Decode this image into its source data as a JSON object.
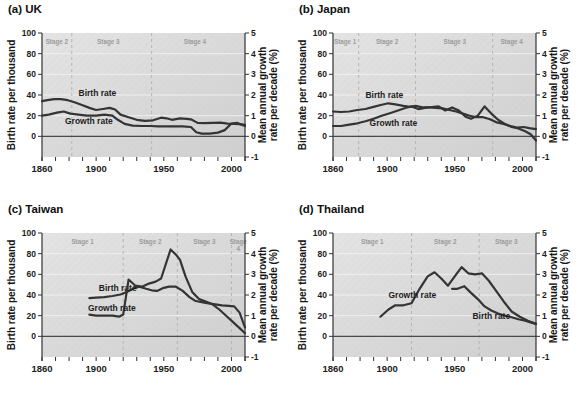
{
  "shared_axes": {
    "left_label": "Birth rate per thousand",
    "right_label_line1": "Mean annual growth",
    "right_label_line2": "rate per decade (%)",
    "left_ticks": [
      0,
      20,
      40,
      60,
      80,
      100
    ],
    "right_ticks": [
      -1,
      0,
      1,
      2,
      3,
      4,
      5
    ],
    "x_ticks_labeled": [
      1860,
      1900,
      1950,
      2000
    ],
    "x_minor_tick_step": 10,
    "x_range": [
      1860,
      2010
    ],
    "left_axis_range": [
      -20,
      100
    ],
    "right_axis_range": [
      -1,
      5
    ]
  },
  "colors": {
    "line": "#343434",
    "plot_bg_light": "#e4e4e4",
    "plot_bg_dark": "#cfcfcf",
    "hatch": "#c6c6c6",
    "gridline": "#efefef",
    "stage_line": "#b5b5b5",
    "stage_label": "#9b9b9b",
    "zero_line": "#4a4a4a",
    "axis_text": "#1c1c1c"
  },
  "chart_data": [
    {
      "type": "line",
      "title": "(a) UK",
      "x_unit": "year",
      "stage_boundaries": [
        1882,
        1941
      ],
      "stage_labels": [
        {
          "text": "Stage 2",
          "year": 1871
        },
        {
          "text": "Stage 3",
          "year": 1909
        },
        {
          "text": "Stage 4",
          "year": 1973
        }
      ],
      "series": [
        {
          "name": "Birth rate",
          "axis": "left",
          "unit": "births per thousand",
          "label": {
            "text": "Birth rate",
            "year": 1887,
            "left_units": 39.5
          },
          "points": [
            [
              1860,
              34
            ],
            [
              1864,
              35
            ],
            [
              1869,
              36
            ],
            [
              1874,
              36
            ],
            [
              1879,
              35
            ],
            [
              1884,
              33
            ],
            [
              1890,
              30
            ],
            [
              1895,
              27.5
            ],
            [
              1900,
              25.5
            ],
            [
              1905,
              26.5
            ],
            [
              1910,
              27.5
            ],
            [
              1914,
              26
            ],
            [
              1918,
              21
            ],
            [
              1924,
              18.5
            ],
            [
              1930,
              16
            ],
            [
              1936,
              15
            ],
            [
              1942,
              15.5
            ],
            [
              1948,
              18
            ],
            [
              1952,
              17.5
            ],
            [
              1956,
              16
            ],
            [
              1962,
              17.5
            ],
            [
              1967,
              17
            ],
            [
              1970,
              16.5
            ],
            [
              1975,
              13
            ],
            [
              1980,
              12.8
            ],
            [
              1986,
              13
            ],
            [
              1992,
              13.2
            ],
            [
              1997,
              12.3
            ],
            [
              2002,
              12
            ],
            [
              2006,
              11.8
            ],
            [
              2010,
              11.2
            ]
          ]
        },
        {
          "name": "Growth rate",
          "axis": "right",
          "unit": "% per year",
          "label": {
            "text": "Growth rate",
            "year": 1877,
            "left_units": 12
          },
          "points": [
            [
              1860,
              1.0
            ],
            [
              1865,
              1.05
            ],
            [
              1871,
              1.15
            ],
            [
              1876,
              1.2
            ],
            [
              1881,
              1.1
            ],
            [
              1887,
              1.05
            ],
            [
              1893,
              1.0
            ],
            [
              1900,
              1.0
            ],
            [
              1906,
              1.05
            ],
            [
              1912,
              1.0
            ],
            [
              1916,
              0.8
            ],
            [
              1921,
              0.6
            ],
            [
              1927,
              0.52
            ],
            [
              1934,
              0.5
            ],
            [
              1940,
              0.5
            ],
            [
              1946,
              0.48
            ],
            [
              1952,
              0.48
            ],
            [
              1958,
              0.48
            ],
            [
              1964,
              0.48
            ],
            [
              1970,
              0.45
            ],
            [
              1974,
              0.2
            ],
            [
              1978,
              0.13
            ],
            [
              1984,
              0.13
            ],
            [
              1990,
              0.18
            ],
            [
              1995,
              0.3
            ],
            [
              2000,
              0.62
            ],
            [
              2004,
              0.65
            ],
            [
              2010,
              0.5
            ]
          ]
        }
      ]
    },
    {
      "type": "line",
      "title": "(b) Japan",
      "x_unit": "year",
      "stage_boundaries": [
        1879,
        1921,
        1978
      ],
      "stage_labels": [
        {
          "text": "Stage 1",
          "year": 1869
        },
        {
          "text": "Stage 2",
          "year": 1900
        },
        {
          "text": "Stage 3",
          "year": 1950
        },
        {
          "text": "Stage 4",
          "year": 1992
        }
      ],
      "series": [
        {
          "name": "Birth rate",
          "axis": "left",
          "unit": "births per thousand",
          "label": {
            "text": "Birth rate",
            "year": 1884,
            "left_units": 37
          },
          "points": [
            [
              1860,
              24
            ],
            [
              1866,
              23.5
            ],
            [
              1872,
              24
            ],
            [
              1878,
              25.5
            ],
            [
              1884,
              26.5
            ],
            [
              1890,
              28.5
            ],
            [
              1896,
              30.5
            ],
            [
              1901,
              32
            ],
            [
              1906,
              31
            ],
            [
              1912,
              29.5
            ],
            [
              1917,
              28.5
            ],
            [
              1921,
              29.5
            ],
            [
              1926,
              28
            ],
            [
              1931,
              28
            ],
            [
              1936,
              27.5
            ],
            [
              1941,
              27
            ],
            [
              1946,
              25.5
            ],
            [
              1951,
              24
            ],
            [
              1956,
              22
            ],
            [
              1961,
              20
            ],
            [
              1966,
              18.5
            ],
            [
              1971,
              18.5
            ],
            [
              1976,
              16.5
            ],
            [
              1981,
              13.5
            ],
            [
              1986,
              12
            ],
            [
              1991,
              10
            ],
            [
              1996,
              8.5
            ],
            [
              2001,
              9
            ],
            [
              2005,
              8
            ],
            [
              2010,
              7
            ]
          ]
        },
        {
          "name": "Growth rate",
          "axis": "right",
          "unit": "% per year",
          "label": {
            "text": "Growth rate",
            "year": 1887,
            "left_units": 10
          },
          "points": [
            [
              1860,
              0.5
            ],
            [
              1866,
              0.5
            ],
            [
              1872,
              0.57
            ],
            [
              1878,
              0.63
            ],
            [
              1884,
              0.73
            ],
            [
              1890,
              0.85
            ],
            [
              1896,
              1.0
            ],
            [
              1902,
              1.12
            ],
            [
              1908,
              1.25
            ],
            [
              1914,
              1.38
            ],
            [
              1918,
              1.45
            ],
            [
              1923,
              1.32
            ],
            [
              1928,
              1.38
            ],
            [
              1933,
              1.42
            ],
            [
              1938,
              1.45
            ],
            [
              1943,
              1.25
            ],
            [
              1948,
              1.4
            ],
            [
              1953,
              1.25
            ],
            [
              1958,
              0.95
            ],
            [
              1962,
              0.85
            ],
            [
              1967,
              1.0
            ],
            [
              1972,
              1.45
            ],
            [
              1977,
              1.1
            ],
            [
              1982,
              0.8
            ],
            [
              1987,
              0.6
            ],
            [
              1992,
              0.45
            ],
            [
              1997,
              0.38
            ],
            [
              2002,
              0.25
            ],
            [
              2006,
              0.1
            ],
            [
              2010,
              -0.2
            ]
          ]
        }
      ]
    },
    {
      "type": "line",
      "title": "(c) Taiwan",
      "x_unit": "year",
      "stage_boundaries": [
        1920,
        1960,
        2000
      ],
      "stage_labels": [
        {
          "text": "Stage 1",
          "year": 1890
        },
        {
          "text": "Stage 2",
          "year": 1940
        },
        {
          "text": "Stage 3",
          "year": 1980
        },
        {
          "text": "Stage",
          "text2": "4",
          "year": 2005
        }
      ],
      "series": [
        {
          "name": "Birth rate",
          "axis": "left",
          "unit": "births per thousand",
          "label": {
            "text": "Birth rate",
            "year": 1902,
            "left_units": 43.5
          },
          "points": [
            [
              1895,
              37
            ],
            [
              1900,
              37.5
            ],
            [
              1906,
              38
            ],
            [
              1912,
              39
            ],
            [
              1918,
              40.5
            ],
            [
              1923,
              43
            ],
            [
              1928,
              46.5
            ],
            [
              1932,
              48
            ],
            [
              1937,
              46
            ],
            [
              1941,
              44.5
            ],
            [
              1945,
              44
            ],
            [
              1950,
              47
            ],
            [
              1954,
              48
            ],
            [
              1959,
              48
            ],
            [
              1964,
              44
            ],
            [
              1969,
              38
            ],
            [
              1973,
              34.5
            ],
            [
              1978,
              33
            ],
            [
              1983,
              32
            ],
            [
              1988,
              31
            ],
            [
              1993,
              30
            ],
            [
              1998,
              29.5
            ],
            [
              2002,
              29
            ],
            [
              2006,
              23
            ],
            [
              2010,
              8.5
            ]
          ]
        },
        {
          "name": "Growth rate",
          "axis": "right",
          "unit": "% per year",
          "label": {
            "text": "Growth rate",
            "year": 1894,
            "left_units": 25
          },
          "points": [
            [
              1895,
              1.05
            ],
            [
              1900,
              1.0
            ],
            [
              1906,
              1.0
            ],
            [
              1912,
              1.0
            ],
            [
              1917,
              0.95
            ],
            [
              1920,
              1.05
            ],
            [
              1924,
              2.75
            ],
            [
              1929,
              2.45
            ],
            [
              1934,
              2.4
            ],
            [
              1939,
              2.55
            ],
            [
              1944,
              2.65
            ],
            [
              1948,
              2.8
            ],
            [
              1955,
              4.2
            ],
            [
              1959,
              3.95
            ],
            [
              1962,
              3.7
            ],
            [
              1966,
              2.9
            ],
            [
              1971,
              2.15
            ],
            [
              1976,
              1.8
            ],
            [
              1981,
              1.68
            ],
            [
              1986,
              1.55
            ],
            [
              1991,
              1.3
            ],
            [
              1996,
              1.0
            ],
            [
              2001,
              0.7
            ],
            [
              2006,
              0.4
            ],
            [
              2010,
              0.15
            ]
          ]
        }
      ]
    },
    {
      "type": "line",
      "title": "(d) Thailand",
      "x_unit": "year",
      "stage_boundaries": [
        1918,
        1968
      ],
      "stage_labels": [
        {
          "text": "Stage 1",
          "year": 1889
        },
        {
          "text": "Stage 2",
          "year": 1943
        },
        {
          "text": "Stage 3",
          "year": 1988
        }
      ],
      "series": [
        {
          "name": "Growth rate",
          "axis": "right",
          "unit": "% per year",
          "label": {
            "text": "Growth rate",
            "year": 1901,
            "left_units": 37.5
          },
          "points": [
            [
              1895,
              0.95
            ],
            [
              1901,
              1.3
            ],
            [
              1906,
              1.5
            ],
            [
              1912,
              1.5
            ],
            [
              1918,
              1.6
            ],
            [
              1924,
              2.3
            ],
            [
              1930,
              2.9
            ],
            [
              1935,
              3.1
            ],
            [
              1940,
              2.8
            ],
            [
              1945,
              2.45
            ],
            [
              1951,
              3.0
            ],
            [
              1955,
              3.35
            ],
            [
              1960,
              3.05
            ],
            [
              1965,
              3.0
            ],
            [
              1970,
              3.05
            ],
            [
              1975,
              2.7
            ],
            [
              1980,
              2.25
            ],
            [
              1986,
              1.7
            ],
            [
              1992,
              1.2
            ],
            [
              1998,
              0.95
            ],
            [
              2004,
              0.75
            ],
            [
              2010,
              0.6
            ]
          ]
        },
        {
          "name": "Birth rate",
          "axis": "left",
          "unit": "births per thousand",
          "label": {
            "text": "Birth rate",
            "year": 1963,
            "left_units": 16.5
          },
          "points": [
            [
              1948,
              46
            ],
            [
              1952,
              46
            ],
            [
              1957,
              48.5
            ],
            [
              1962,
              42
            ],
            [
              1967,
              36
            ],
            [
              1972,
              29
            ],
            [
              1977,
              25
            ],
            [
              1982,
              22
            ],
            [
              1987,
              20
            ],
            [
              1992,
              18.5
            ],
            [
              1997,
              16.5
            ],
            [
              2002,
              15
            ],
            [
              2006,
              13.5
            ],
            [
              2010,
              12
            ]
          ]
        }
      ]
    }
  ]
}
